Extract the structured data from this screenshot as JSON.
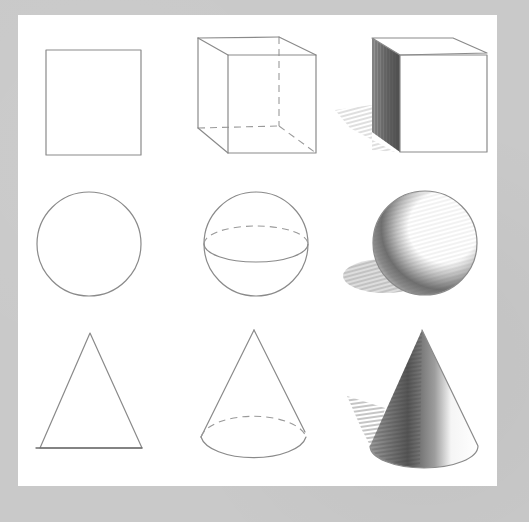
{
  "scene": {
    "description": "Pencil drawing study sheet: 3x3 grid showing progression from 2D outline to 3D wireframe to shaded form",
    "background_color": "#c9c9c9",
    "paper_color": "#ffffff",
    "stroke_color": "#8a8a8a",
    "rows": [
      {
        "name": "box",
        "cells": [
          {
            "stage": "flat",
            "shape": "square"
          },
          {
            "stage": "wireframe",
            "shape": "cube",
            "hidden_edges": "dashed"
          },
          {
            "stage": "shaded",
            "shape": "cube",
            "cast_shadow": "left"
          }
        ]
      },
      {
        "name": "round",
        "cells": [
          {
            "stage": "flat",
            "shape": "circle"
          },
          {
            "stage": "wireframe",
            "shape": "sphere",
            "hidden_edges": "dashed"
          },
          {
            "stage": "shaded",
            "shape": "sphere",
            "cast_shadow": "left"
          }
        ]
      },
      {
        "name": "pointed",
        "cells": [
          {
            "stage": "flat",
            "shape": "triangle"
          },
          {
            "stage": "wireframe",
            "shape": "cone",
            "hidden_edges": "dashed"
          },
          {
            "stage": "shaded",
            "shape": "cone",
            "cast_shadow": "left"
          }
        ]
      }
    ]
  }
}
